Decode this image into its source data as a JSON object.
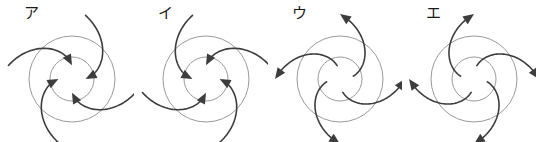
{
  "figure": {
    "title": "",
    "background_color": "#ffffff",
    "width": 537,
    "height": 142,
    "ring_color": "#9a9a9a",
    "arrow_color": "#3d3d3d",
    "panel_count": 4
  },
  "panels": [
    {
      "label": "ア",
      "label_romaji": "a",
      "x": 0,
      "center_x": 72,
      "center_y": 79,
      "outer_radius": 43,
      "inner_radius": 22,
      "arrow_count": 4,
      "flow_direction": "inward",
      "swirl": "clockwise",
      "description": "Four curved arrows spiral inward toward the center, bending clockwise",
      "arrow_angles_deg": [
        90,
        180,
        270,
        0
      ]
    },
    {
      "label": "イ",
      "label_romaji": "i",
      "x": 134,
      "center_x": 72,
      "center_y": 79,
      "outer_radius": 43,
      "inner_radius": 22,
      "arrow_count": 4,
      "flow_direction": "inward",
      "swirl": "counterclockwise",
      "description": "Four curved arrows spiral inward toward the center, bending counterclockwise",
      "arrow_angles_deg": [
        90,
        180,
        270,
        0
      ]
    },
    {
      "label": "ウ",
      "label_romaji": "u",
      "x": 268,
      "center_x": 72,
      "center_y": 79,
      "outer_radius": 43,
      "inner_radius": 22,
      "arrow_count": 4,
      "flow_direction": "outward",
      "swirl": "counterclockwise",
      "description": "Four curved arrows spiral outward away from the center, bending counterclockwise",
      "arrow_angles_deg": [
        90,
        180,
        270,
        0
      ]
    },
    {
      "label": "エ",
      "label_romaji": "e",
      "x": 402,
      "center_x": 72,
      "center_y": 79,
      "outer_radius": 43,
      "inner_radius": 22,
      "arrow_count": 4,
      "flow_direction": "outward",
      "swirl": "clockwise",
      "description": "Four curved arrows spiral outward away from the center, bending clockwise",
      "arrow_angles_deg": [
        90,
        180,
        270,
        0
      ]
    }
  ]
}
